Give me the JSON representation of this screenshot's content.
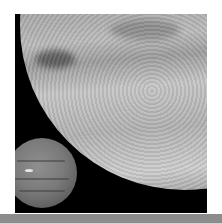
{
  "image": {
    "subject": "Triton with Neptune in background",
    "background_color": "#000000",
    "frame_color": "#ffffff",
    "bottom_bar_color": "#8c8c8c"
  }
}
